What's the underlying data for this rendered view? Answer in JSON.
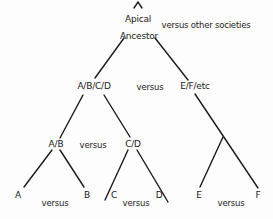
{
  "diagram": {
    "type": "segmentary-lineage-tree",
    "root": {
      "line1": "Apical",
      "line2": "Ancestor",
      "comparison": "versus other societies"
    },
    "level1": {
      "left": "A/B/C/D",
      "versus": "versus",
      "right": "E/F/etc"
    },
    "level2": {
      "left": "A/B",
      "versus": "versus",
      "right": "C/D"
    },
    "leaves": {
      "a": "A",
      "ab_versus": "versus",
      "b": "B",
      "c": "C",
      "cd_versus": "versus",
      "d": "D",
      "e": "E",
      "ef_versus": "versus",
      "f": "F"
    },
    "line_color": "#1a1a1a"
  }
}
